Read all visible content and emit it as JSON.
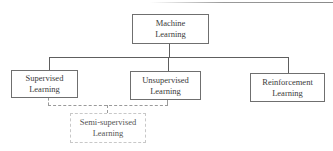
{
  "diagram": {
    "type": "hierarchy",
    "root": {
      "label_line1": "Machine",
      "label_line2": "Learning"
    },
    "children": [
      {
        "label_line1": "Supervised",
        "label_line2": "Learning"
      },
      {
        "label_line1": "Unsupervised",
        "label_line2": "Learning"
      },
      {
        "label_line1": "Reinforcement",
        "label_line2": "Learning"
      }
    ],
    "bridge": {
      "label_line1": "Semi-supervised",
      "label_line2": "Learning",
      "connects": [
        "Supervised Learning",
        "Unsupervised Learning"
      ],
      "style": "dashed"
    }
  }
}
